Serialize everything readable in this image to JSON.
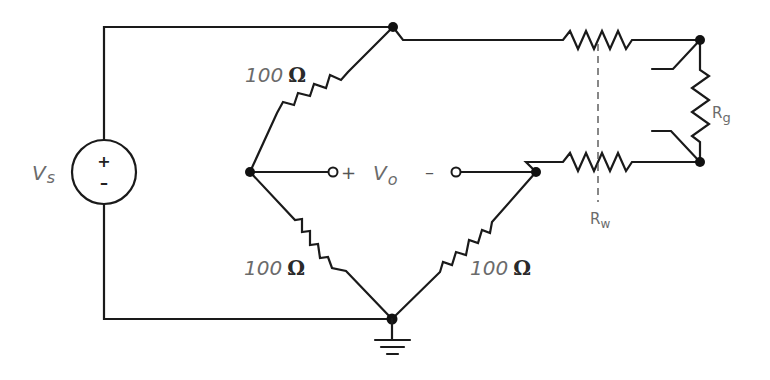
{
  "diagram": {
    "title": "",
    "type": "Wheatstone bridge strain-gauge circuit with lead wires",
    "source": {
      "label_main": "V",
      "label_sub": "s",
      "plus": "+",
      "minus": "–"
    },
    "resistors": [
      {
        "id": "r-top-left",
        "value": "100",
        "unit": "Ω"
      },
      {
        "id": "r-bottom-left",
        "value": "100",
        "unit": "Ω"
      },
      {
        "id": "r-bottom-right",
        "value": "100",
        "unit": "Ω"
      },
      {
        "id": "r-gauge",
        "label_main": "R",
        "label_sub": "g"
      },
      {
        "id": "r-wire",
        "label_main": "R",
        "label_sub": "w"
      }
    ],
    "output": {
      "plus": "+",
      "label_main": "V",
      "label_sub": "o",
      "minus": "–"
    },
    "colors": {
      "wire": "#1a1a1a",
      "label": "#6b6b6b",
      "background": "#ffffff"
    }
  }
}
